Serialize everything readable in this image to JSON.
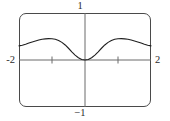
{
  "figure": {
    "title": "",
    "frame_color": "#4a4a4a",
    "axis_color": "#6b6b6b",
    "curve_color": "#1f1f1f",
    "background": "#ffffff"
  },
  "labels": {
    "x_min": "-2",
    "x_max": "2",
    "y_max": "1",
    "y_min": "−1"
  },
  "chart_data": {
    "type": "line",
    "title": "",
    "xlabel": "",
    "ylabel": "",
    "xlim": [
      -2,
      2
    ],
    "ylim": [
      -1,
      1
    ],
    "grid": false,
    "legend": "none",
    "xticks": [
      -1,
      1
    ],
    "xtick_labels": [
      "",
      ""
    ],
    "yticks": [],
    "annotations": [
      "viewport corners rounded (graphing-calculator style frame)",
      "x-axis drawn at y = 0 across full width",
      "y-axis drawn at x = 0 across full height",
      "curve is even/symmetric about the y-axis",
      "curve touches y = 0 at x = 0 (minimum)",
      "local maxima near x = ±1 at y ≈ 0.45",
      "curve ends near y ≈ 0.30 at x = ±2"
    ],
    "series": [
      {
        "name": "curve",
        "x": [
          -2.0,
          -1.9,
          -1.8,
          -1.7,
          -1.6,
          -1.5,
          -1.4,
          -1.3,
          -1.2,
          -1.1,
          -1.0,
          -0.9,
          -0.8,
          -0.7,
          -0.6,
          -0.5,
          -0.4,
          -0.3,
          -0.2,
          -0.1,
          0.0,
          0.1,
          0.2,
          0.3,
          0.4,
          0.5,
          0.6,
          0.7,
          0.8,
          0.9,
          1.0,
          1.1,
          1.2,
          1.3,
          1.4,
          1.5,
          1.6,
          1.7,
          1.8,
          1.9,
          2.0
        ],
        "values": [
          0.3,
          0.315,
          0.335,
          0.36,
          0.385,
          0.405,
          0.425,
          0.44,
          0.45,
          0.455,
          0.452,
          0.44,
          0.415,
          0.375,
          0.32,
          0.25,
          0.175,
          0.105,
          0.048,
          0.012,
          0.0,
          0.012,
          0.048,
          0.105,
          0.175,
          0.25,
          0.32,
          0.375,
          0.415,
          0.44,
          0.452,
          0.455,
          0.45,
          0.44,
          0.425,
          0.405,
          0.385,
          0.36,
          0.335,
          0.315,
          0.3
        ]
      }
    ]
  }
}
